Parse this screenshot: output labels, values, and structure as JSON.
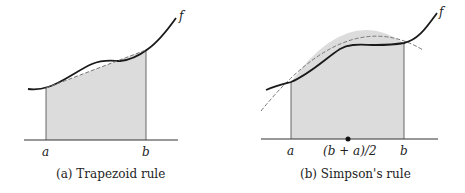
{
  "panels": [
    {
      "caption": "(a) Trapezoid rule",
      "labels": {
        "a": "a",
        "b": "b",
        "f": "f"
      }
    },
    {
      "caption": "(b) Simpson's rule",
      "labels": {
        "a": "a",
        "mid": "(b + a)/2",
        "b": "b",
        "f": "f"
      }
    }
  ],
  "colors": {
    "curve": "#1a1a1a",
    "fill": "#d9d9d9",
    "dashed": "#777777",
    "axis": "#333333"
  }
}
